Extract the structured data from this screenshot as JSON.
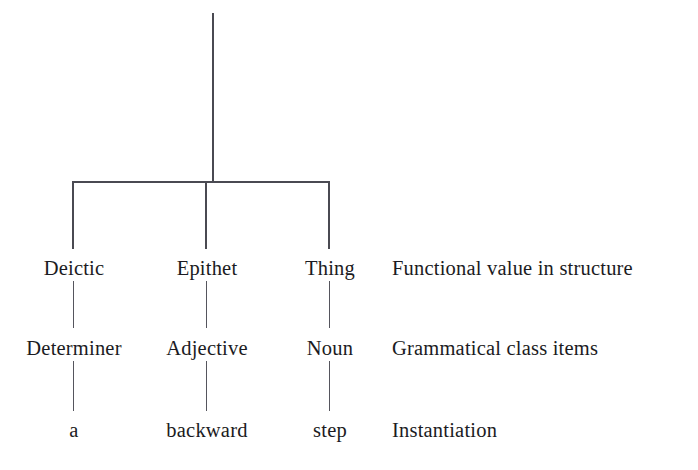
{
  "diagram": {
    "type": "linguistic-constituent-tree",
    "background_color": "#ffffff",
    "line_color": "#4a4a52",
    "text_color": "#1b1b22",
    "root": {
      "label": "",
      "stem": {
        "x": 213,
        "y_top": 13,
        "y_bottom": 182
      }
    },
    "branch_bar": {
      "x_left": 73,
      "x_right": 329,
      "y": 182
    },
    "columns": [
      {
        "x": 73,
        "function_label": "Deictic",
        "class_label": "Determiner",
        "instance_label": "a"
      },
      {
        "x": 206,
        "function_label": "Epithet",
        "class_label": "Adjective",
        "instance_label": "backward"
      },
      {
        "x": 329,
        "function_label": "Thing",
        "class_label": "Noun",
        "instance_label": "step"
      }
    ],
    "row_annotations": [
      {
        "text": "Functional value in structure",
        "x": 392,
        "y": 275
      },
      {
        "text": "Grammatical class items",
        "x": 392,
        "y": 355
      },
      {
        "text": "Instantiation",
        "x": 392,
        "y": 437
      }
    ],
    "rows": [
      {
        "name": "function",
        "baseline_y": 275
      },
      {
        "name": "class",
        "baseline_y": 355
      },
      {
        "name": "instantiation",
        "baseline_y": 437
      }
    ]
  }
}
